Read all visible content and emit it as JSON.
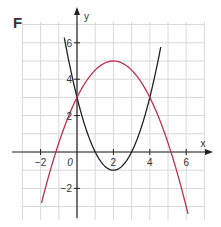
{
  "panel_label": "F",
  "chart_data": {
    "type": "line",
    "title": "F",
    "xlabel": "x",
    "ylabel": "y",
    "xlim": [
      -3,
      7
    ],
    "ylim": [
      -3.5,
      7
    ],
    "grid": true,
    "x_ticks": [
      -2,
      2,
      4,
      6
    ],
    "y_ticks": [
      -2,
      2,
      4,
      6
    ],
    "origin_label": "0",
    "series": [
      {
        "name": "black parabola",
        "color": "#222222",
        "equation": "y = x^2 - 4x + 3",
        "vertex": [
          2,
          -1
        ],
        "roots": [
          1,
          3
        ],
        "x_range": [
          -0.7,
          4.6
        ]
      },
      {
        "name": "red parabola",
        "color": "#c0304a",
        "equation": "y = -0.5(x-2)^2 + 5",
        "vertex": [
          2,
          5
        ],
        "roots": [
          -1.16,
          5.16
        ],
        "x_range": [
          -1.95,
          6.1
        ]
      }
    ],
    "intersections": [
      [
        0,
        3
      ],
      [
        4,
        3
      ]
    ]
  },
  "colors": {
    "grid": "#d8d8d8",
    "axis": "#222222",
    "black_curve": "#222222",
    "red_curve": "#c0304a"
  }
}
